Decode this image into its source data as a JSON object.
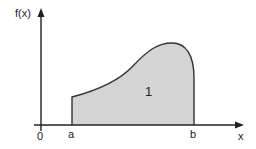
{
  "diagram": {
    "y_axis_label": "f(x)",
    "x_axis_label": "x",
    "origin_label": "0",
    "lower_bound_label": "a",
    "upper_bound_label": "b",
    "area_label": "1",
    "colors": {
      "axis": "#222222",
      "curve": "#333333",
      "fill": "#d4d4d4",
      "background": "#ffffff"
    }
  }
}
